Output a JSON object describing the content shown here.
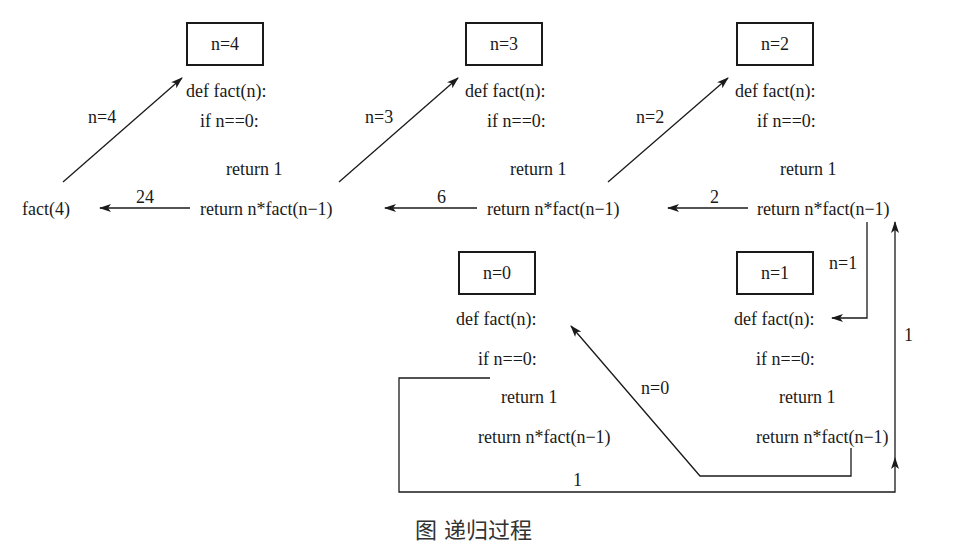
{
  "diagram": {
    "type": "recursion-call-trace",
    "caller": "fact(4)",
    "frames": [
      {
        "box": "n=4",
        "def": "def fact(n):",
        "if": "if n==0:",
        "ret1": "return 1",
        "retn": "return n*fact(n−1)"
      },
      {
        "box": "n=3",
        "def": "def fact(n):",
        "if": "if n==0:",
        "ret1": "return 1",
        "retn": "return n*fact(n−1)"
      },
      {
        "box": "n=2",
        "def": "def fact(n):",
        "if": "if n==0:",
        "ret1": "return 1",
        "retn": "return n*fact(n−1)"
      },
      {
        "box": "n=1",
        "def": "def fact(n):",
        "if": "if n==0:",
        "ret1": "return 1",
        "retn": "return n*fact(n−1)"
      },
      {
        "box": "n=0",
        "def": "def fact(n):",
        "if": "if n==0:",
        "ret1": "return 1",
        "retn": "return n*fact(n−1)"
      }
    ],
    "call_labels": [
      "n=4",
      "n=3",
      "n=2",
      "n=1",
      "n=0"
    ],
    "return_labels": [
      "24",
      "6",
      "2",
      "1",
      "1"
    ],
    "caption": "图 递归过程"
  }
}
